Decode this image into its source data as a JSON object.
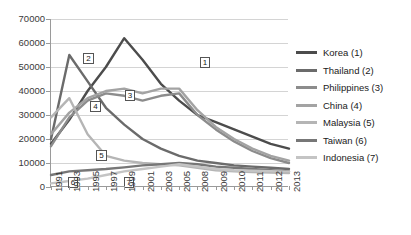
{
  "chart_data": {
    "type": "line",
    "title": "",
    "xlabel": "",
    "ylabel": "",
    "ylim": [
      0,
      70000
    ],
    "ytick_labels": [
      "0",
      "10000",
      "20000",
      "30000",
      "40000",
      "50000",
      "60000",
      "70000"
    ],
    "ytick_values": [
      0,
      10000,
      20000,
      30000,
      40000,
      50000,
      60000,
      70000
    ],
    "grid": true,
    "legend_position": "right",
    "categories": [
      "1991",
      "1993",
      "1995",
      "1997",
      "1999",
      "2001",
      "2003",
      "2005",
      "2008",
      "2009",
      "2010",
      "2011",
      "2012",
      "2013"
    ],
    "series": [
      {
        "name": "Korea (1)",
        "label": "1",
        "color": "#4c4c4c",
        "values": [
          18000,
          28000,
          40000,
          50000,
          62000,
          53000,
          43000,
          36000,
          30000,
          27000,
          24000,
          21000,
          18000,
          16000
        ]
      },
      {
        "name": "Thailand (2)",
        "label": "2",
        "color": "#6b6b6b",
        "values": [
          20000,
          55000,
          44000,
          33000,
          26000,
          20000,
          16000,
          13000,
          11000,
          10000,
          9000,
          8500,
          8000,
          7500
        ]
      },
      {
        "name": "Philippines (3)",
        "label": "3",
        "color": "#8c8c8c",
        "values": [
          17000,
          29000,
          36000,
          39000,
          38000,
          36000,
          38000,
          39000,
          30000,
          24000,
          19000,
          15000,
          12000,
          10000
        ]
      },
      {
        "name": "China (4)",
        "label": "4",
        "color": "#a3a3a3",
        "values": [
          22000,
          31000,
          37000,
          40000,
          41000,
          39000,
          41000,
          41000,
          32000,
          25000,
          20000,
          16000,
          13000,
          11000
        ]
      },
      {
        "name": "Malaysia (5)",
        "label": "5",
        "color": "#b5b5b5",
        "values": [
          29000,
          37000,
          22000,
          13000,
          11000,
          10000,
          9500,
          9000,
          8000,
          7000,
          6500,
          6200,
          6000,
          5800
        ]
      },
      {
        "name": "Taiwan (6)",
        "label": "6",
        "color": "#777777",
        "values": [
          5000,
          6500,
          7000,
          7500,
          8200,
          9000,
          9500,
          10000,
          9500,
          8500,
          8000,
          7500,
          7000,
          6500
        ]
      },
      {
        "name": "Indonesia (7)",
        "label": "7",
        "color": "#c4c4c4",
        "values": [
          1500,
          2500,
          3500,
          5000,
          6500,
          7500,
          8500,
          9500,
          8500,
          7500,
          7000,
          6800,
          6600,
          6400
        ]
      }
    ],
    "annotations": [
      {
        "label": "2",
        "x_pct": 13.5,
        "y_pct": 20.5
      },
      {
        "label": "1",
        "x_pct": 62.5,
        "y_pct": 22.5
      },
      {
        "label": "4",
        "x_pct": 16.5,
        "y_pct": 49.0
      },
      {
        "label": "3",
        "x_pct": 31.0,
        "y_pct": 42.0
      },
      {
        "label": "5",
        "x_pct": 19.0,
        "y_pct": 78.0
      },
      {
        "label": "6",
        "x_pct": 7.0,
        "y_pct": 94.0
      },
      {
        "label": "7",
        "x_pct": 30.5,
        "y_pct": 94.0
      }
    ]
  },
  "legend": {
    "items": [
      {
        "label": "Korea (1)"
      },
      {
        "label": "Thailand (2)"
      },
      {
        "label": "Philippines (3)"
      },
      {
        "label": "China (4)"
      },
      {
        "label": "Malaysia (5)"
      },
      {
        "label": "Taiwan (6)"
      },
      {
        "label": "Indonesia (7)"
      }
    ]
  }
}
